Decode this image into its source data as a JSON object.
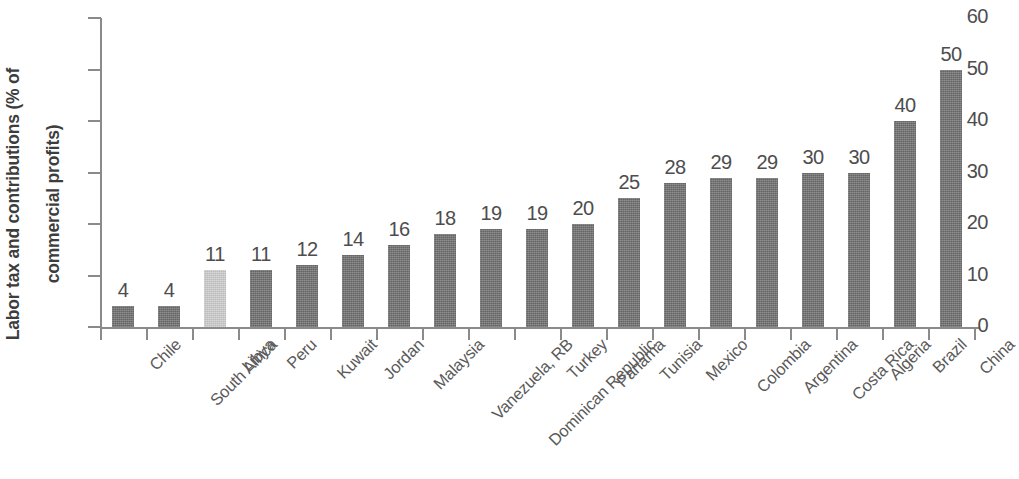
{
  "chart_data": {
    "type": "bar",
    "title": "",
    "subtitle": "",
    "xlabel": "",
    "ylabel": "Labor tax and contributions (% of\ncommercial profits)",
    "ylabel_line1": "Labor tax and contributions (% of",
    "ylabel_line2": "commercial profits)",
    "ylim": [
      0,
      60
    ],
    "ytick_values": [
      0,
      10,
      20,
      30,
      40,
      50,
      60
    ],
    "ytick_labels": [
      "0",
      "10",
      "20",
      "30",
      "40",
      "50",
      "60"
    ],
    "grid": false,
    "legend": "none",
    "categories": [
      "Chile",
      "South Africa",
      "Libya",
      "Peru",
      "Kuwait",
      "Jordan",
      "Malaysia",
      "Vanezuela, RB",
      "Dominican Republic",
      "Turkey",
      "Panama",
      "Tunisia",
      "Mexico",
      "Colombia",
      "Argentina",
      "Costa Rica",
      "Algeria",
      "Brazil",
      "China"
    ],
    "values": [
      4,
      4,
      11,
      11,
      12,
      14,
      16,
      18,
      19,
      19,
      20,
      25,
      28,
      29,
      29,
      30,
      30,
      40,
      50
    ],
    "value_labels": [
      "4",
      "4",
      "11",
      "11",
      "12",
      "14",
      "16",
      "18",
      "19",
      "19",
      "20",
      "25",
      "28",
      "29",
      "29",
      "30",
      "30",
      "40",
      "50"
    ],
    "bar_colors": [
      "#6f6f6f",
      "#6f6f6f",
      "#cdcdcd",
      "#6f6f6f",
      "#6f6f6f",
      "#6f6f6f",
      "#6f6f6f",
      "#6f6f6f",
      "#6f6f6f",
      "#6f6f6f",
      "#6f6f6f",
      "#6f6f6f",
      "#6f6f6f",
      "#6f6f6f",
      "#6f6f6f",
      "#6f6f6f",
      "#6f6f6f",
      "#6f6f6f",
      "#6f6f6f"
    ],
    "highlight_category": "Libya",
    "highlight_color": "#cdcdcd",
    "bar_color": "#6f6f6f",
    "axis_color": "#8a8a8a",
    "text_color": "#4d4d4d"
  }
}
